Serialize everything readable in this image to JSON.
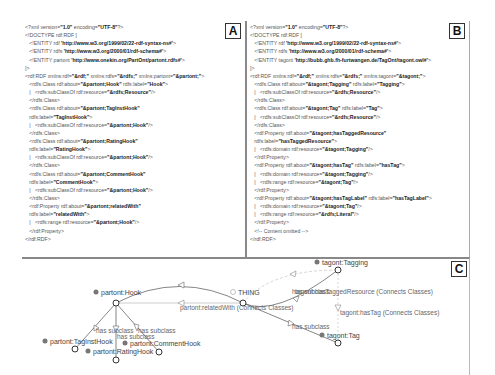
{
  "panels": {
    "a": {
      "label": "A",
      "lines": [
        "<?xml version=\"1.0\" encoding=\"UTF-8\"?>",
        "<!DOCTYPE rdf:RDF [",
        "   <!ENTITY rdf 'http://www.w3.org/1999/02/22-rdf-syntax-ns#'>",
        "   <!ENTITY rdfs 'http://www.w3.org/2000/01/rdf-schema#'>",
        "   <!ENTITY partont 'http://www.onekin.org/PartOnt/partont.rdfs#'>",
        "]>",
        "<rdf:RDF xmlns:rdf=\"&rdf;\" xmlns:rdfs=\"&rdfs;\" xmlns:partont=\"&partont;\">",
        "   <rdfs:Class rdf:about=\"&partont;Hook\" rdfs:label=\"Hook\">",
        "   |   <rdfs:subClassOf rdf:resource=\"&rdfs;Resource\"/>",
        "   </rdfs:Class>",
        "   <rdfs:Class rdf:about=\"&partont;TagInstHook\"",
        "   rdfs:label=\"TagInstHook\">",
        "   |   <rdfs:subClassOf rdf:resource=\"&partont;Hook\"/>",
        "   </rdfs:Class>",
        "   <rdfs:Class rdf:about=\"&partont;RatingHook\"",
        "   rdfs:label=\"RatingHook\">",
        "   |   <rdfs:subClassOf rdf:resource=\"&partont;Hook\"/>",
        "   </rdfs:Class>",
        "   <rdfs:Class rdf:about=\"&partont;CommentHook\"",
        "   rdfs:label=\"CommentHook\">",
        "   |   <rdfs:subClassOf rdf:resource=\"&partont;Hook\"/>",
        "   </rdfs:Class>",
        "   <rdf:Property rdf:about=\"&partont;relatedWith\"",
        "   rdfs:label=\"relatedWith\">",
        "   |   <rdfs:range rdf:resource=\"&partont;Hook\"/>",
        "   </rdf:Property>",
        "</rdf:RDF>"
      ]
    },
    "b": {
      "label": "B",
      "lines": [
        "<?xml version=\"1.0\" encoding=\"UTF-8\"?>",
        "<!DOCTYPE rdf:RDF [",
        "   <!ENTITY rdf 'http://www.w3.org/1999/02/22-rdf-syntax-ns#'>",
        "   <!ENTITY rdfs 'http://www.w3.org/2000/01/rdf-schema#'>",
        "   <!ENTITY tagont 'http://bubb.ghb.fh-furtwangen.de/TagOnt/tagont.owl#'>",
        "]>",
        "<rdf:RDF xmlns:rdf=\"&rdf;\" xmlns:rdfs=\"&rdfs;\" xmlns:tagont=\"&tagont;\">",
        "   <rdfs:Class rdf:about=\"&tagont;Tagging\" rdfs:label=\"Tagging\">",
        "   |   <rdfs:subClassOf rdf:resource=\"&rdfs;Resource\"/>",
        "   </rdfs:Class>",
        "   <rdfs:Class rdf:about=\"&tagont;Tag\" rdfs:label=\"Tag\">",
        "   |   <rdfs:subClassOf rdf:resource=\"&rdfs;Resource\"/>",
        "   </rdfs:Class>",
        "   <rdf:Property rdf:about=\"&tagont;hasTaggedResource\"",
        "   rdfs:label=\"hasTaggedResource\">",
        "   |   <rdfs:domain rdf:resource=\"&tagont;Tagging\"/>",
        "   </rdf:Property>",
        "   <rdf:Property rdf:about=\"&tagont;hasTag\" rdfs:label=\"hasTag\">",
        "   |   <rdfs:domain rdf:resource=\"&tagont;Tagging\"/>",
        "   |   <rdfs:range rdf:resource=\"&tagont;Tag\"/>",
        "   </rdf:Property>",
        "   <rdf:Property rdf:about=\"&tagont;hasTagLabel\" rdfs:label=\"hasTagLabel\">",
        "   |   <rdfs:domain rdf:resource=\"&tagont;Tag\"/>",
        "   |   <rdfs:range rdf:resource=\"&rdfs;Literal\"/>",
        "   </rdf:Property>",
        "   <!-- Content omitted -->",
        "</rdf:RDF>"
      ]
    },
    "c": {
      "label": "C",
      "nodes": {
        "hook": "partont:Hook",
        "thing": "THING",
        "tagging": "tagont:Tagging",
        "taginsthook": "partont:TagInstHook",
        "ratinghook": "partont:RatingHook",
        "commenthook": "partont:CommentHook",
        "tag": "tagont:Tag"
      },
      "edges": {
        "related_with": "partont:relatedWith (Connects Classes)",
        "has_subclass_1": "has subclass",
        "has_subclass_2": "has subclass",
        "has_subclass_3": "has subclass",
        "has_subclass_tag": "has subclass",
        "has_subclass_tagging": "has subclass",
        "tagged_resource": "tagont:hasTaggedResource (Connects Classes)",
        "has_tag": "tagont:hasTag (Connects Classes)"
      }
    }
  }
}
